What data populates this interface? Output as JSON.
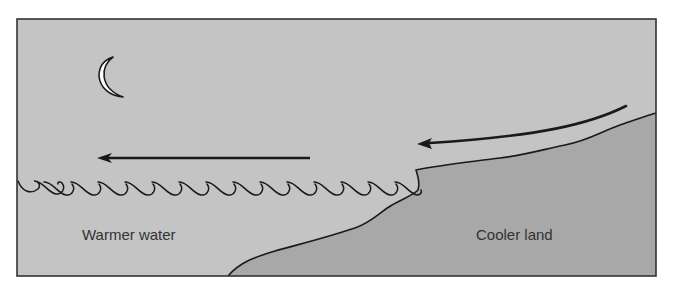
{
  "diagram": {
    "labels": {
      "water": "Warmer water",
      "land": "Cooler land"
    },
    "elements": {
      "moon": "crescent-moon-icon",
      "arrow_upper": "curved arrow from land toward sea",
      "arrow_lower": "straight arrow pointing left over water",
      "waves": "wave line at water surface",
      "coastline": "land boundary"
    },
    "colors": {
      "sky": "#c4c4c4",
      "water": "#c4c4c4",
      "land": "#a8a8a8",
      "outline": "#1a1a1a",
      "moon": "#ffffff",
      "text": "#333333"
    }
  }
}
